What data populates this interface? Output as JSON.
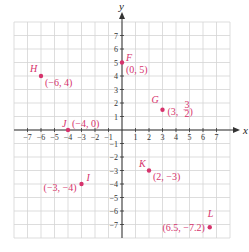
{
  "colors": {
    "grid": "#d4d4d4",
    "axis": "#333333",
    "point": "#d6336c",
    "label": "#d6336c"
  },
  "chart_data": {
    "type": "scatter",
    "title": "",
    "xlabel": "x",
    "ylabel": "y",
    "xlim": [
      -8,
      8
    ],
    "ylim": [
      -8,
      8
    ],
    "grid": true,
    "x_ticks": [
      -7,
      -6,
      -5,
      -4,
      -3,
      -2,
      -1,
      1,
      2,
      3,
      4,
      5,
      6,
      7
    ],
    "y_ticks": [
      7,
      6,
      5,
      4,
      3,
      2,
      1,
      -1,
      -2,
      -3,
      -4,
      -5,
      -6,
      -7
    ],
    "points": [
      {
        "name": "F",
        "x": 0,
        "y": 5,
        "label": "(0, 5)"
      },
      {
        "name": "G",
        "x": 3,
        "y": 1.5,
        "label": "(3, 3/2)"
      },
      {
        "name": "H",
        "x": -6,
        "y": 4,
        "label": "(−6, 4)"
      },
      {
        "name": "I",
        "x": -3,
        "y": -4,
        "label": "(−3, −4)"
      },
      {
        "name": "J",
        "x": -4,
        "y": 0,
        "label": "(−4, 0)"
      },
      {
        "name": "K",
        "x": 2,
        "y": -3,
        "label": "(2, −3)"
      },
      {
        "name": "L",
        "x": 6.5,
        "y": -7.2,
        "label": "(6.5, −7.2)"
      }
    ]
  }
}
